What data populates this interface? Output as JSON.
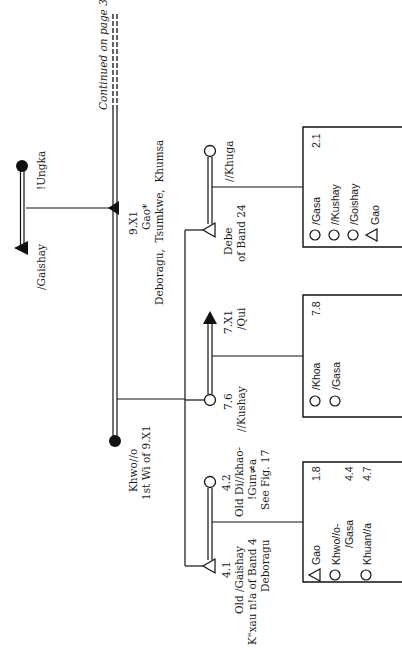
{
  "diagram": {
    "type": "kinship-chart",
    "orientation": "rotated-90-clockwise",
    "continuation_note": "Continued on page 309",
    "generation_1": {
      "female": {
        "name": "!Ungka",
        "symbol": "filled-circle"
      },
      "male": {
        "name": "/Gaishay",
        "symbol": "filled-triangle"
      }
    },
    "generation_2": {
      "husband": {
        "id": "9.X1",
        "name": "Gao*",
        "places": "Deboragu,  Tsumkwe,  Khumsa",
        "symbol": "filled-triangle"
      },
      "wife": {
        "name": "Khwo//o",
        "note": "1st Wi of 9.X1",
        "symbol": "filled-circle"
      }
    },
    "couples": [
      {
        "child": {
          "name": "Debe",
          "note": "of Band 24",
          "symbol": "open-triangle"
        },
        "spouse": {
          "name": "//Khuga",
          "symbol": "open-circle"
        },
        "children_box": {
          "corner_value": "2.1",
          "items": [
            {
              "symbol": "open-circle",
              "name": "/Gasa",
              "value": ""
            },
            {
              "symbol": "open-circle",
              "name": "//Kushay",
              "value": ""
            },
            {
              "symbol": "open-circle",
              "name": "/Goishay",
              "value": ""
            },
            {
              "symbol": "open-triangle",
              "name": "Gao",
              "value": ""
            }
          ]
        }
      },
      {
        "child": {
          "id": "7.6",
          "name": "//Kushay",
          "symbol": "open-circle"
        },
        "spouse": {
          "id": "7.X1",
          "name": "/Qui",
          "symbol": "filled-triangle"
        },
        "children_box": {
          "corner_value": "7.8",
          "items": [
            {
              "symbol": "open-circle",
              "name": "/Khoa",
              "value": ""
            },
            {
              "symbol": "open-circle",
              "name": "/Gasa",
              "value": ""
            }
          ]
        }
      },
      {
        "child": {
          "id": "4.1",
          "name": "Old /Gaishay",
          "note": "K\"xau n!a of Band 4",
          "place": "Deboragu",
          "symbol": "open-triangle"
        },
        "spouse": {
          "id": "4.2",
          "name": "Old Di//khao-",
          "name_cont": "!Gun≠a",
          "note": "See Fig. 17",
          "symbol": "open-circle"
        },
        "children_box": {
          "corner_value": "",
          "items": [
            {
              "symbol": "open-triangle",
              "name": "Gao",
              "value": "1.8"
            },
            {
              "symbol": "open-circle",
              "name": "Khwo//o-",
              "name_cont": "/Gasa",
              "value": "4.4"
            },
            {
              "symbol": "open-circle",
              "name": "Khuan//a",
              "value": "4.7"
            }
          ]
        }
      }
    ]
  }
}
